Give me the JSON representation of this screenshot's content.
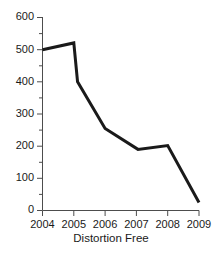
{
  "chart_data": {
    "type": "line",
    "title": "",
    "xlabel": "Distortion Free",
    "ylabel": "",
    "x": [
      2004,
      2005,
      2005,
      2006,
      2007,
      2008,
      2009
    ],
    "values": [
      500,
      521,
      400,
      255,
      190,
      202,
      25
    ],
    "series": [
      {
        "name": "Distortion Free",
        "points": [
          {
            "x": 2004.0,
            "y": 500
          },
          {
            "x": 2005.0,
            "y": 521
          },
          {
            "x": 2005.12,
            "y": 400
          },
          {
            "x": 2006.0,
            "y": 255
          },
          {
            "x": 2007.05,
            "y": 190
          },
          {
            "x": 2008.0,
            "y": 202
          },
          {
            "x": 2009.0,
            "y": 25
          }
        ]
      }
    ],
    "xlim": [
      2004,
      2009
    ],
    "ylim": [
      0,
      600
    ],
    "ytick_labels": [
      "0",
      "100",
      "200",
      "300",
      "400",
      "500",
      "600"
    ],
    "ytick_values": [
      0,
      100,
      200,
      300,
      400,
      500,
      600
    ],
    "yminor_step": 50,
    "xtick_labels": [
      "2004",
      "2005",
      "2006",
      "2007",
      "2008",
      "2009"
    ],
    "xtick_values": [
      2004,
      2005,
      2006,
      2007,
      2008,
      2009
    ],
    "grid": false,
    "legend": "none",
    "line_color": "#1a1a1a",
    "axis_color": "#4d4d4d",
    "background_color": "#ffffff"
  },
  "axis": {
    "y_labels": [
      "600",
      "500",
      "400",
      "300",
      "200",
      "100",
      "0"
    ],
    "x_labels": [
      "2004",
      "2005",
      "2006",
      "2007",
      "2008",
      "2009"
    ]
  },
  "labels": {
    "x_axis_title": "Distortion Free",
    "chart_title": ""
  }
}
